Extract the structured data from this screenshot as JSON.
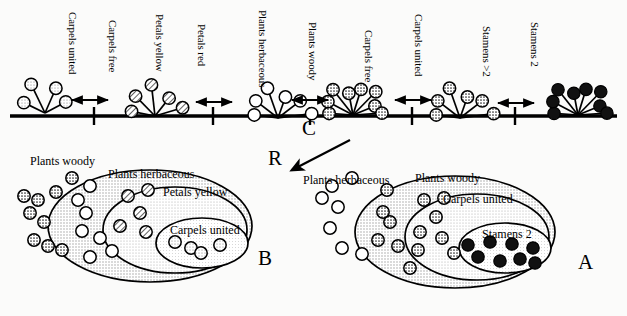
{
  "figure": {
    "type": "diagram",
    "colors": {
      "line": "#000000",
      "open_circle_fill": "#ffffff",
      "light_gray_fill": "#d6d6d6",
      "hatch_fill": "#cfcfcf",
      "stipple_fill": "#bdbdbd",
      "black_fill": "#111111",
      "ellipse_shade_outer": "#d9d9d9",
      "ellipse_shade_mid": "#e6e6e6",
      "ellipse_shade_inner": "#efefef"
    }
  },
  "axis": {
    "name": "character-state-axis",
    "interval_labels": [
      {
        "id": "carpels-united",
        "label": "Carpels united",
        "x": 78,
        "y": 12
      },
      {
        "id": "carpels-free",
        "label": "Carpels free",
        "x": 118,
        "y": 20
      },
      {
        "id": "petals-yellow",
        "label": "Petals yellow",
        "x": 165,
        "y": 14
      },
      {
        "id": "petals-red",
        "label": "Petals red",
        "x": 207,
        "y": 24
      },
      {
        "id": "plants-herbaceous",
        "label": "Plants herbaceous",
        "x": 268,
        "y": 10
      },
      {
        "id": "plants-woody",
        "label": "Plants woody",
        "x": 318,
        "y": 22
      },
      {
        "id": "carpels-free-2",
        "label": "Carpels free",
        "x": 374,
        "y": 30
      },
      {
        "id": "carpels-united-2",
        "label": "Carpels united",
        "x": 424,
        "y": 14
      },
      {
        "id": "stamens-gt2",
        "label": "Stamens >2",
        "x": 492,
        "y": 26
      },
      {
        "id": "stamens-2",
        "label": "Stamens 2",
        "x": 540,
        "y": 22
      }
    ],
    "nodes": [
      {
        "id": "node-1",
        "x": 45,
        "y": 113,
        "fill": "light",
        "rays": 4,
        "label": "carpels-united-star"
      },
      {
        "id": "node-2",
        "x": 155,
        "y": 116,
        "fill": "hatch",
        "rays": 5,
        "label": "petals-yellow-star"
      },
      {
        "id": "node-3",
        "x": 278,
        "y": 118,
        "fill": "open",
        "rays": 6,
        "label": "plants-herbaceous-star"
      },
      {
        "id": "node-4",
        "x": 353,
        "y": 115,
        "fill": "stipple",
        "rays": 8,
        "label": "plants-woody-star"
      },
      {
        "id": "node-5",
        "x": 460,
        "y": 118,
        "fill": "stipple",
        "rays": 6,
        "label": "carpels-united-star-2"
      },
      {
        "id": "node-6",
        "x": 578,
        "y": 115,
        "fill": "black",
        "rays": 8,
        "label": "stamens-2-star"
      }
    ],
    "ticks_x": [
      94,
      213,
      310,
      412,
      515
    ],
    "arrows": [
      {
        "id": "arrow-1",
        "x1": 72,
        "x2": 108,
        "y": 100
      },
      {
        "id": "arrow-2",
        "x1": 196,
        "x2": 232,
        "y": 102
      },
      {
        "id": "arrow-3",
        "x1": 292,
        "x2": 328,
        "y": 100
      },
      {
        "id": "arrow-4",
        "x1": 395,
        "x2": 431,
        "y": 100
      },
      {
        "id": "arrow-5",
        "x1": 498,
        "x2": 534,
        "y": 103
      }
    ]
  },
  "annotations": {
    "c_label": "C",
    "r_label": "R",
    "c_pos": {
      "x": 302,
      "y": 127
    },
    "r_pos": {
      "x": 272,
      "y": 158
    },
    "pointer": {
      "x1": 350,
      "y1": 140,
      "x2": 292,
      "y2": 170
    }
  },
  "diagram_b": {
    "name": "nested-set-diagram-b",
    "letter": "B",
    "letter_pos": {
      "x": 258,
      "y": 258
    },
    "outside_label": {
      "text": "Plants woody",
      "x": 30,
      "y": 155
    },
    "sets": [
      {
        "id": "b-outer",
        "label": "Plants herbaceous",
        "label_x": 108,
        "label_y": 168,
        "cx": 150,
        "cy": 226,
        "rx": 102,
        "ry": 56
      },
      {
        "id": "b-mid",
        "label": "Petals yellow",
        "label_x": 163,
        "label_y": 186,
        "cx": 175,
        "cy": 230,
        "rx": 72,
        "ry": 43
      },
      {
        "id": "b-inner",
        "label": "Carpels united",
        "label_x": 170,
        "label_y": 224,
        "cx": 202,
        "cy": 243,
        "rx": 46,
        "ry": 25
      }
    ],
    "circles_outside": [
      [
        72,
        178
      ],
      [
        56,
        192
      ],
      [
        24,
        196
      ],
      [
        38,
        200
      ],
      [
        30,
        213
      ],
      [
        44,
        222
      ],
      [
        34,
        240
      ],
      [
        48,
        246
      ],
      [
        62,
        250
      ]
    ],
    "circles_outer_band": [
      [
        90,
        186
      ],
      [
        78,
        200
      ],
      [
        86,
        213
      ],
      [
        82,
        231
      ],
      [
        100,
        238
      ],
      [
        112,
        251
      ],
      [
        90,
        257
      ]
    ],
    "circles_mid_band": [
      [
        128,
        196
      ],
      [
        148,
        190
      ],
      [
        140,
        213
      ],
      [
        120,
        226
      ],
      [
        146,
        232
      ]
    ],
    "circles_inner": [
      [
        175,
        242
      ],
      [
        191,
        248
      ],
      [
        201,
        253
      ],
      [
        220,
        245
      ]
    ]
  },
  "diagram_a": {
    "name": "nested-set-diagram-a",
    "letter": "A",
    "letter_pos": {
      "x": 578,
      "y": 262
    },
    "outside_label": {
      "text": "Plants herbaceous",
      "x": 303,
      "y": 174
    },
    "sets": [
      {
        "id": "a-outer",
        "label": "Plants woody",
        "label_x": 415,
        "label_y": 172,
        "cx": 455,
        "cy": 232,
        "rx": 100,
        "ry": 56
      },
      {
        "id": "a-mid",
        "label": "Carpels united",
        "label_x": 443,
        "label_y": 193,
        "cx": 477,
        "cy": 237,
        "rx": 72,
        "ry": 43
      },
      {
        "id": "a-inner",
        "label": "Stamens 2",
        "label_x": 482,
        "label_y": 228,
        "cx": 505,
        "cy": 248,
        "rx": 46,
        "ry": 25
      }
    ],
    "circles_outside": [
      [
        352,
        178
      ],
      [
        332,
        186
      ],
      [
        322,
        198
      ],
      [
        338,
        207
      ],
      [
        330,
        228
      ],
      [
        342,
        248
      ],
      [
        362,
        254
      ]
    ],
    "circles_outer_band": [
      [
        387,
        190
      ],
      [
        383,
        212
      ],
      [
        390,
        222
      ],
      [
        378,
        240
      ],
      [
        398,
        246
      ],
      [
        418,
        250
      ],
      [
        410,
        268
      ]
    ],
    "circles_mid_band": [
      [
        424,
        200
      ],
      [
        444,
        198
      ],
      [
        436,
        217
      ],
      [
        420,
        232
      ],
      [
        442,
        238
      ],
      [
        454,
        253
      ]
    ],
    "circles_inner": [
      [
        468,
        245
      ],
      [
        490,
        242
      ],
      [
        512,
        244
      ],
      [
        533,
        248
      ],
      [
        478,
        257
      ],
      [
        500,
        261
      ],
      [
        520,
        259
      ],
      [
        535,
        263
      ]
    ]
  }
}
